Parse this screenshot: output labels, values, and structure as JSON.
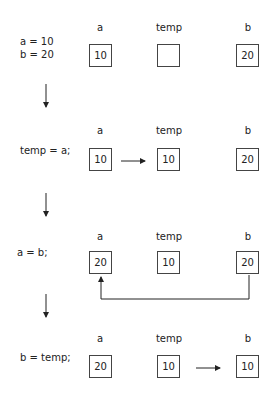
{
  "diagram": {
    "column_labels": [
      "a",
      "temp",
      "b"
    ],
    "steps": [
      {
        "code_lines": [
          "a = 10",
          "b = 20"
        ],
        "values": {
          "a": "10",
          "temp": "",
          "b": "20"
        },
        "arrow": null
      },
      {
        "code_lines": [
          "temp = a;"
        ],
        "values": {
          "a": "10",
          "temp": "10",
          "b": "20"
        },
        "arrow": "a-to-temp"
      },
      {
        "code_lines": [
          "a = b;"
        ],
        "values": {
          "a": "20",
          "temp": "10",
          "b": "20"
        },
        "arrow": "b-to-a"
      },
      {
        "code_lines": [
          "b = temp;"
        ],
        "values": {
          "a": "20",
          "temp": "10",
          "b": "10"
        },
        "arrow": "temp-to-b"
      }
    ],
    "colors": {
      "line": "#222222",
      "box_border": "#444444",
      "text": "#222222"
    }
  }
}
